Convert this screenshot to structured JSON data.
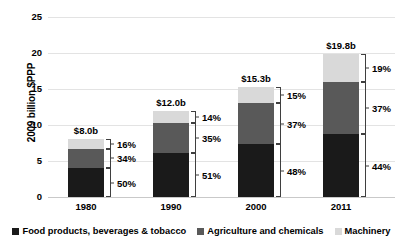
{
  "chart_data": {
    "type": "bar",
    "subtype": "stacked-bar",
    "title": "",
    "xlabel": "",
    "ylabel": "2009 billion $PPP",
    "ylim": [
      0,
      25
    ],
    "yticks": [
      0,
      5,
      10,
      15,
      20,
      25
    ],
    "grid": true,
    "legend_position": "bottom",
    "categories": [
      "1980",
      "1990",
      "2000",
      "2011"
    ],
    "totals": [
      8.0,
      12.0,
      15.3,
      19.8
    ],
    "total_labels": [
      "$8.0b",
      "$12.0b",
      "$15.3b",
      "$19.8b"
    ],
    "series": [
      {
        "name": "Food products, beverages & tobacco",
        "color": "#1a1a1a",
        "percent_labels": [
          "50%",
          "51%",
          "48%",
          "44%"
        ],
        "percents": [
          50,
          51,
          48,
          44
        ],
        "values": [
          4.0,
          6.12,
          7.34,
          8.71
        ]
      },
      {
        "name": "Agriculture and chemicals",
        "color": "#595959",
        "percent_labels": [
          "34%",
          "35%",
          "37%",
          "37%"
        ],
        "percents": [
          34,
          35,
          37,
          37
        ],
        "values": [
          2.72,
          4.2,
          5.66,
          7.33
        ]
      },
      {
        "name": "Machinery",
        "color": "#d9d9d9",
        "percent_labels": [
          "16%",
          "14%",
          "15%",
          "19%"
        ],
        "percents": [
          16,
          14,
          15,
          19
        ],
        "values": [
          1.28,
          1.68,
          2.3,
          3.76
        ]
      }
    ]
  },
  "axis": {
    "y_title": "2009 billion $PPP",
    "y_tick_labels": [
      "25",
      "20",
      "15",
      "10",
      "5",
      "0"
    ],
    "x_tick_labels": [
      "1980",
      "1990",
      "2000",
      "2011"
    ]
  },
  "legend": {
    "items": [
      {
        "label": "Food products, beverages & tobacco",
        "color": "#1a1a1a"
      },
      {
        "label": "Agriculture and chemicals",
        "color": "#595959"
      },
      {
        "label": "Machinery",
        "color": "#d9d9d9"
      }
    ]
  },
  "bars": [
    {
      "category": "1980",
      "total_label": "$8.0b",
      "segments": [
        {
          "series": "Machinery",
          "percent_label": "16%"
        },
        {
          "series": "Agriculture and chemicals",
          "percent_label": "34%"
        },
        {
          "series": "Food products, beverages & tobacco",
          "percent_label": "50%"
        }
      ]
    },
    {
      "category": "1990",
      "total_label": "$12.0b",
      "segments": [
        {
          "series": "Machinery",
          "percent_label": "14%"
        },
        {
          "series": "Agriculture and chemicals",
          "percent_label": "35%"
        },
        {
          "series": "Food products, beverages & tobacco",
          "percent_label": "51%"
        }
      ]
    },
    {
      "category": "2000",
      "total_label": "$15.3b",
      "segments": [
        {
          "series": "Machinery",
          "percent_label": "15%"
        },
        {
          "series": "Agriculture and chemicals",
          "percent_label": "37%"
        },
        {
          "series": "Food products, beverages & tobacco",
          "percent_label": "48%"
        }
      ]
    },
    {
      "category": "2011",
      "total_label": "$19.8b",
      "segments": [
        {
          "series": "Machinery",
          "percent_label": "19%"
        },
        {
          "series": "Agriculture and chemicals",
          "percent_label": "37%"
        },
        {
          "series": "Food products, beverages & tobacco",
          "percent_label": "44%"
        }
      ]
    }
  ]
}
